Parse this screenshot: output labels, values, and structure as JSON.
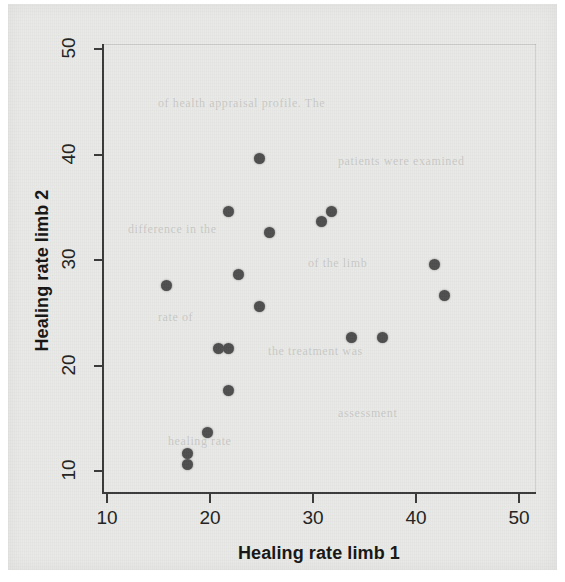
{
  "figure": {
    "background_color": "#e9e9e7",
    "point_color": "#4e4e4e",
    "axis_color": "#3a3a3a"
  },
  "ghost_text": [
    {
      "text": "of health appraisal profile. The",
      "x": 150,
      "y": 92
    },
    {
      "text": "patients were examined",
      "x": 330,
      "y": 150
    },
    {
      "text": "difference in the",
      "x": 120,
      "y": 218
    },
    {
      "text": "of the limb",
      "x": 300,
      "y": 252
    },
    {
      "text": "rate of",
      "x": 150,
      "y": 306
    },
    {
      "text": "the treatment was",
      "x": 260,
      "y": 340
    },
    {
      "text": "assessment",
      "x": 330,
      "y": 402
    },
    {
      "text": "healing rate",
      "x": 160,
      "y": 430
    }
  ],
  "chart_data": {
    "type": "scatter",
    "title": "",
    "xlabel": "Healing rate limb 1",
    "ylabel": "Healing rate limb 2",
    "xlim": [
      7.5,
      50
    ],
    "ylim": [
      7.5,
      50
    ],
    "xticks": [
      10,
      20,
      30,
      40,
      50
    ],
    "yticks": [
      10,
      20,
      30,
      40,
      50
    ],
    "xtick_labels": [
      "10",
      "20",
      "30",
      "40",
      "50"
    ],
    "ytick_labels": [
      "10",
      "20",
      "30",
      "40",
      "50"
    ],
    "grid": false,
    "legend": false,
    "marker": "filled-circle",
    "n_points": 18,
    "points": [
      {
        "x": 15,
        "y": 28
      },
      {
        "x": 17,
        "y": 12
      },
      {
        "x": 17,
        "y": 11
      },
      {
        "x": 19,
        "y": 14
      },
      {
        "x": 20,
        "y": 22
      },
      {
        "x": 21,
        "y": 22
      },
      {
        "x": 21,
        "y": 18
      },
      {
        "x": 21,
        "y": 35
      },
      {
        "x": 22,
        "y": 29
      },
      {
        "x": 24,
        "y": 40
      },
      {
        "x": 24,
        "y": 26
      },
      {
        "x": 25,
        "y": 33
      },
      {
        "x": 30,
        "y": 34
      },
      {
        "x": 31,
        "y": 35
      },
      {
        "x": 33,
        "y": 23
      },
      {
        "x": 36,
        "y": 23
      },
      {
        "x": 41,
        "y": 30
      },
      {
        "x": 42,
        "y": 27
      }
    ]
  }
}
